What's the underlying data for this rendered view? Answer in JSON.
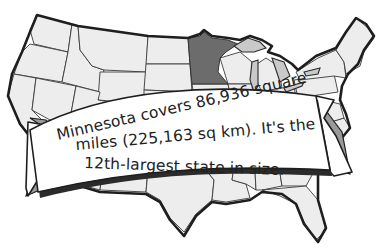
{
  "image": {
    "subject": "Map of the contiguous United States",
    "highlighted_state": "Minnesota",
    "colors": {
      "background": "#ffffff",
      "state_fill": "#ededed",
      "highlight_fill": "#6c6c6c",
      "lake_fill": "#c9c9c9",
      "outline": "#1e1e1e",
      "ribbon_fill": "#ffffff",
      "text": "#222222"
    }
  },
  "banner": {
    "lines": [
      "Minnesota covers 86,936 square",
      "miles (225,163 sq km). It's the",
      "12th-largest state in size."
    ]
  }
}
